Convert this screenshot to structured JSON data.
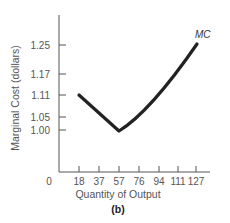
{
  "chart_data": {
    "type": "line",
    "title": "",
    "caption": "(b)",
    "xlabel": "Quantity of Output",
    "ylabel": "Marginal Cost (dollars)",
    "x_origin_label": "0",
    "x_ticks": [
      18,
      37,
      57,
      76,
      94,
      111,
      127
    ],
    "y_ticks": [
      "1.00",
      "1.05",
      "1.11",
      "1.17",
      "1.25"
    ],
    "series": [
      {
        "name": "MC",
        "x": [
          18,
          37,
          57,
          76,
          94,
          111,
          127
        ],
        "y": [
          1.11,
          1.05,
          1.0,
          1.05,
          1.11,
          1.17,
          1.25
        ]
      }
    ],
    "grid": false,
    "legend": "inline label at curve end"
  }
}
